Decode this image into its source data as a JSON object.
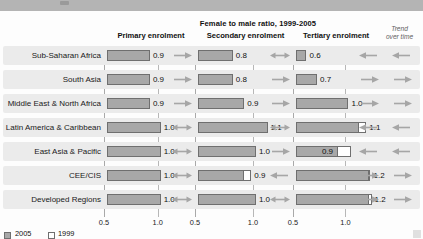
{
  "header": {
    "supertitle": "Female to male ratio, 1999-2005",
    "columns": [
      "Primary enrolment",
      "Secondary enrolment",
      "Tertiary enrolment"
    ],
    "trend_header_line1": "Trend",
    "trend_header_line2": "over time"
  },
  "legend": {
    "items": [
      {
        "label": "2005",
        "swatch": "filled",
        "color": "#a8a8a8"
      },
      {
        "label": "1999",
        "swatch": "outline",
        "color": "#ffffff"
      }
    ]
  },
  "axis": {
    "ticks": [
      "0.5",
      "1.0"
    ],
    "min": 0.5,
    "max": 1.32
  },
  "chart_data": {
    "type": "bar",
    "title": "Female to male ratio, 1999-2005",
    "xlabel": "",
    "ylabel": "",
    "xlim": [
      0.5,
      1.32
    ],
    "grid": true,
    "legend_position": "bottom-left",
    "categories": [
      "Sub-Saharan Africa",
      "South Asia",
      "Middle East & North Africa",
      "Latin America & Caribbean",
      "East Asia & Pacific",
      "CEE/CIS",
      "Developed Regions"
    ],
    "panels": [
      {
        "name": "Primary enrolment",
        "values_2005": [
          0.9,
          0.9,
          0.9,
          1.0,
          1.0,
          1.0,
          1.0
        ],
        "values_1999": [
          0.85,
          0.84,
          0.86,
          0.99,
          0.99,
          0.99,
          0.99
        ],
        "labels": [
          "0.9",
          "0.9",
          "0.9",
          "1.0",
          "1.0",
          "1.0",
          "1.0"
        ],
        "trends": [
          "up",
          "up",
          "up",
          "flat",
          "flat",
          "flat",
          "flat"
        ]
      },
      {
        "name": "Secondary enrolment",
        "values_2005": [
          0.8,
          0.8,
          0.9,
          1.1,
          1.0,
          0.9,
          1.0
        ],
        "values_1999": [
          0.79,
          0.8,
          0.84,
          1.08,
          0.99,
          0.96,
          0.99
        ],
        "labels": [
          "0.8",
          "0.8",
          "0.9",
          "1.1",
          "1.0",
          "0.9",
          "1.0"
        ],
        "trends": [
          "flat",
          "up",
          "up",
          "flat",
          "up",
          "down",
          "flat"
        ]
      },
      {
        "name": "Tertiary enrolment",
        "values_2005": [
          0.6,
          0.7,
          1.0,
          1.1,
          0.9,
          1.2,
          1.2
        ],
        "values_1999": [
          0.58,
          0.62,
          0.93,
          1.17,
          1.02,
          1.21,
          1.22
        ],
        "labels": [
          "0.6",
          "0.7",
          "1.0",
          "1.1",
          "0.9",
          "1.2",
          "1.2"
        ],
        "trends": [
          "down",
          "up",
          "up",
          "down",
          "down",
          "up",
          "up"
        ]
      }
    ],
    "trend_over_time": [
      "down",
      "up",
      "up",
      "down",
      "down",
      "up",
      "up"
    ]
  }
}
